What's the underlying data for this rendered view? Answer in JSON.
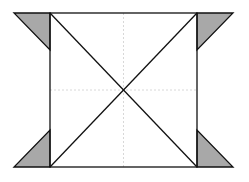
{
  "diagram": {
    "colors": {
      "background": "#ffffff",
      "stroke": "#111111",
      "fill_triangle": "#a8a8a8",
      "dashed": "#d8d8d8"
    },
    "square": {
      "x1": 50,
      "y1": 13,
      "x2": 197,
      "y2": 167
    },
    "triangles": [
      {
        "name": "top-left",
        "points": "14,13 50,13 50,50"
      },
      {
        "name": "top-right",
        "points": "197,13 233,13 197,50"
      },
      {
        "name": "bottom-left",
        "points": "14,167 50,167 50,130"
      },
      {
        "name": "bottom-right",
        "points": "197,167 233,167 197,130"
      }
    ]
  }
}
